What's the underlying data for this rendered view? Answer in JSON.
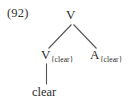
{
  "example": {
    "number_label": "(92)"
  },
  "tree": {
    "root": {
      "category": "V",
      "subscript": ""
    },
    "left_child": {
      "category": "V",
      "subscript": "{clear}"
    },
    "right_child": {
      "category": "A",
      "subscript": "{clear}"
    },
    "leaf": {
      "text": "clear"
    }
  },
  "style": {
    "line_color": "#555555",
    "text_color": "#2b2b2b",
    "background": "#ffffff"
  }
}
